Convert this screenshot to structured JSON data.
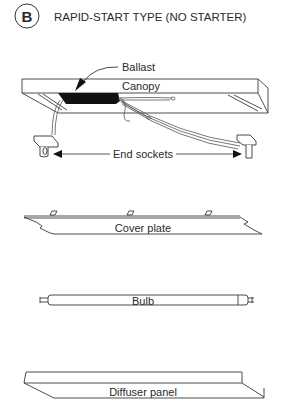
{
  "header": {
    "badge": "B",
    "title": "RAPID-START TYPE  (NO STARTER)"
  },
  "labels": {
    "ballast": "Ballast",
    "canopy": "Canopy",
    "end_sockets": "End sockets",
    "cover_plate": "Cover plate",
    "bulb": "Bulb",
    "diffuser_panel": "Diffuser panel"
  },
  "colors": {
    "line": "#3a3a3a",
    "ballast_fill": "#111111",
    "background": "#ffffff"
  }
}
